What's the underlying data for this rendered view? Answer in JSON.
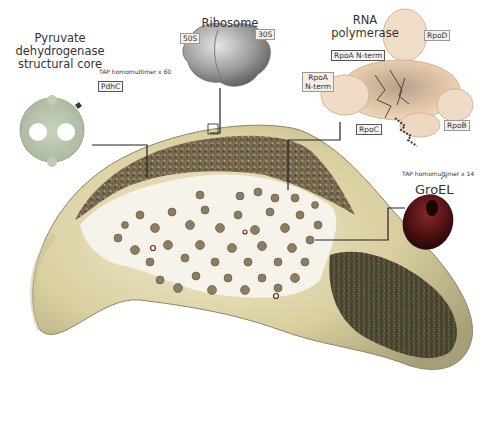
{
  "figure": {
    "complexes": [
      {
        "id": "pdh",
        "title_lines": [
          "Pyruvate",
          "dehydrogenase",
          "structural core"
        ],
        "tap_note": "TAP homomultimer x 60",
        "subunit_label": "PdhC",
        "color": "#b9c4ae"
      },
      {
        "id": "ribosome",
        "title": "Ribosome",
        "subunit_labels": [
          "50S",
          "30S"
        ],
        "color": "#9a9a9a"
      },
      {
        "id": "rnap",
        "title_lines": [
          "RNA",
          "polymerase"
        ],
        "subunit_labels": {
          "rpoD": "RpoD",
          "rpoA_nterm_top": "RpoA N-term",
          "rpoA_nterm_left_1": "RpoA",
          "rpoA_nterm_left_2": "N-term",
          "rpoC": "RpoC",
          "rpoB": "RpoB"
        },
        "color": "#e8c9a8"
      },
      {
        "id": "groel",
        "title": "GroEL",
        "tap_note": "TAP homomultimer x 14",
        "color": "#5a1414"
      }
    ],
    "cell": {
      "membrane_color": "#d8cfa2",
      "ribosome_particle_color": "#9b8a6e",
      "dense_region_color": "#4a5a3a"
    }
  }
}
